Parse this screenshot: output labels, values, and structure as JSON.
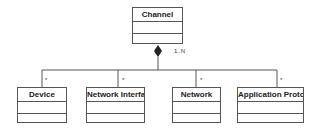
{
  "diagram": {
    "type": "uml-class-composition",
    "parent": {
      "name": "Channel",
      "multiplicity": "1..N"
    },
    "children": [
      {
        "name": "Device",
        "multiplicity": "*"
      },
      {
        "name": "Network Interface",
        "multiplicity": "*"
      },
      {
        "name": "Network",
        "multiplicity": "*"
      },
      {
        "name": "Application Protocol",
        "multiplicity": "*"
      }
    ],
    "colors": {
      "line": "#555555",
      "diamond": "#222222",
      "text": "#222222"
    }
  }
}
